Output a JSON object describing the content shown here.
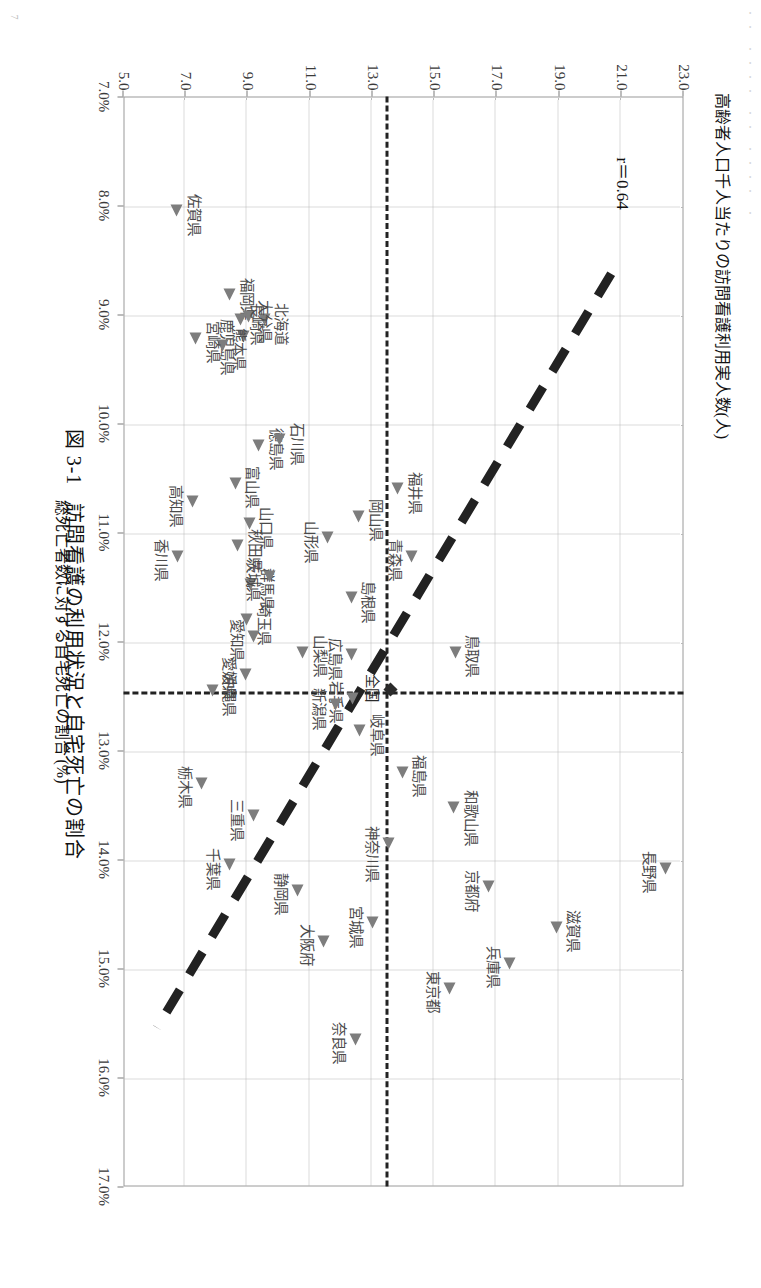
{
  "page": {
    "header_marks": "・・  ・・・・ ・・ ・・・・  ・",
    "folio": "7"
  },
  "caption": {
    "number": "図 3-1",
    "text": "訪問看護の利用状況と自宅死亡の割合"
  },
  "annotation": {
    "correlation": "r＝0.64"
  },
  "chart_data": {
    "type": "scatter",
    "title": "訪問看護の利用状況と自宅死亡の割合",
    "xlabel": "総死亡者数に対する自宅死亡の割合 (%)",
    "ylabel": "高齢者人口千人当たりの訪問看護利用実人数(人)",
    "xlim": [
      7.0,
      17.0
    ],
    "ylim": [
      5.0,
      23.0
    ],
    "xticks": [
      "7.0%",
      "8.0%",
      "9.0%",
      "10.0%",
      "11.0%",
      "12.0%",
      "13.0%",
      "14.0%",
      "15.0%",
      "16.0%",
      "17.0%"
    ],
    "yticks": [
      "5.0",
      "7.0",
      "9.0",
      "11.0",
      "13.0",
      "15.0",
      "17.0",
      "19.0",
      "21.0",
      "23.0"
    ],
    "grid": true,
    "legend": "none",
    "correlation": 0.64,
    "national_average": {
      "label": "全国",
      "x": 12.45,
      "y": 13.55
    },
    "trendline": {
      "x0": 8.62,
      "y0": 20.7,
      "x1": 15.55,
      "y1": 6.05,
      "style": "dashed"
    },
    "points": [
      {
        "label": "佐賀県",
        "x": 8.05,
        "y": 6.75,
        "lp": "t"
      },
      {
        "label": "北海道",
        "x": 9.05,
        "y": 9.55,
        "lp": "t"
      },
      {
        "label": "福岡県",
        "x": 8.82,
        "y": 8.45,
        "lp": "t"
      },
      {
        "label": "大分県",
        "x": 9.02,
        "y": 9.05,
        "lp": "t"
      },
      {
        "label": "長崎県",
        "x": 9.05,
        "y": 8.78,
        "lp": "t"
      },
      {
        "label": "鹿児島県",
        "x": 9.2,
        "y": 8.9,
        "lp": "b"
      },
      {
        "label": "熊本県",
        "x": 9.28,
        "y": 8.2,
        "lp": "t"
      },
      {
        "label": "宮崎県",
        "x": 9.22,
        "y": 7.35,
        "lp": "t"
      },
      {
        "label": "徳島県",
        "x": 10.2,
        "y": 9.38,
        "lp": "t"
      },
      {
        "label": "石川県",
        "x": 10.15,
        "y": 10.05,
        "lp": "t"
      },
      {
        "label": "富山県",
        "x": 10.55,
        "y": 8.62,
        "lp": "t"
      },
      {
        "label": "高知県",
        "x": 10.72,
        "y": 7.25,
        "lp": "b"
      },
      {
        "label": "香川県",
        "x": 11.22,
        "y": 6.78,
        "lp": "b"
      },
      {
        "label": "山口県",
        "x": 10.92,
        "y": 9.08,
        "lp": "t"
      },
      {
        "label": "秋田県",
        "x": 11.12,
        "y": 8.7,
        "lp": "t"
      },
      {
        "label": "群馬県",
        "x": 11.48,
        "y": 9.1,
        "lp": "t"
      },
      {
        "label": "茨城県",
        "x": 11.4,
        "y": 9.72,
        "lp": "b"
      },
      {
        "label": "埼玉県",
        "x": 11.8,
        "y": 9.0,
        "lp": "t"
      },
      {
        "label": "愛知県",
        "x": 11.95,
        "y": 9.22,
        "lp": "b"
      },
      {
        "label": "愛媛県",
        "x": 12.3,
        "y": 8.95,
        "lp": "b"
      },
      {
        "label": "山梨県",
        "x": 12.1,
        "y": 10.8,
        "lp": "t"
      },
      {
        "label": "山形県",
        "x": 11.05,
        "y": 11.6,
        "lp": "b"
      },
      {
        "label": "岡山県",
        "x": 10.85,
        "y": 12.6,
        "lp": "t"
      },
      {
        "label": "島根県",
        "x": 11.6,
        "y": 12.35,
        "lp": "t"
      },
      {
        "label": "福井県",
        "x": 10.6,
        "y": 13.85,
        "lp": "t"
      },
      {
        "label": "青森県",
        "x": 11.22,
        "y": 14.3,
        "lp": "b"
      },
      {
        "label": "広島県",
        "x": 12.12,
        "y": 12.35,
        "lp": "b"
      },
      {
        "label": "全国",
        "x": 12.45,
        "y": 13.55,
        "lp": "b",
        "national": true
      },
      {
        "label": "岩手県",
        "x": 12.52,
        "y": 12.4,
        "lp": "b"
      },
      {
        "label": "新潟県",
        "x": 12.58,
        "y": 11.85,
        "lp": "b"
      },
      {
        "label": "岐阜県",
        "x": 12.82,
        "y": 12.62,
        "lp": "t"
      },
      {
        "label": "沖縄県",
        "x": 12.45,
        "y": 7.88,
        "lp": "t"
      },
      {
        "label": "栃木県",
        "x": 13.3,
        "y": 7.55,
        "lp": "b"
      },
      {
        "label": "三重県",
        "x": 13.6,
        "y": 9.2,
        "lp": "b"
      },
      {
        "label": "千葉県",
        "x": 14.05,
        "y": 8.45,
        "lp": "b"
      },
      {
        "label": "静岡県",
        "x": 14.28,
        "y": 10.62,
        "lp": "b"
      },
      {
        "label": "鳥取県",
        "x": 12.1,
        "y": 15.7,
        "lp": "t"
      },
      {
        "label": "和歌山県",
        "x": 13.52,
        "y": 15.65,
        "lp": "t"
      },
      {
        "label": "福島県",
        "x": 13.2,
        "y": 14.0,
        "lp": "t"
      },
      {
        "label": "神奈川県",
        "x": 13.85,
        "y": 13.55,
        "lp": "b"
      },
      {
        "label": "宮城県",
        "x": 14.58,
        "y": 13.05,
        "lp": "b"
      },
      {
        "label": "奈良県",
        "x": 15.65,
        "y": 12.5,
        "lp": "b"
      },
      {
        "label": "大阪府",
        "x": 14.75,
        "y": 11.45,
        "lp": "b"
      },
      {
        "label": "京都府",
        "x": 14.25,
        "y": 16.75,
        "lp": "b"
      },
      {
        "label": "兵庫県",
        "x": 14.95,
        "y": 17.45,
        "lp": "b"
      },
      {
        "label": "滋賀県",
        "x": 14.62,
        "y": 18.95,
        "lp": "t"
      },
      {
        "label": "東京都",
        "x": 15.18,
        "y": 15.5,
        "lp": "b"
      },
      {
        "label": "長野県",
        "x": 14.08,
        "y": 22.45,
        "lp": "b"
      }
    ]
  }
}
